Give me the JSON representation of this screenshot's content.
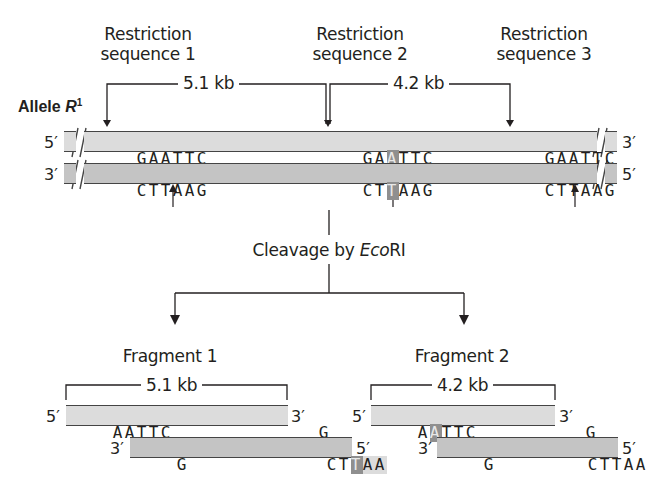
{
  "top": {
    "site_labels": [
      {
        "line1": "Restriction",
        "line2": "sequence 1"
      },
      {
        "line1": "Restriction",
        "line2": "sequence 2"
      },
      {
        "line1": "Restriction",
        "line2": "sequence 3"
      }
    ],
    "distances": [
      "5.1 kb",
      "4.2 kb"
    ],
    "allele_label": "Allele ",
    "allele_name": "R",
    "allele_superscript": "1",
    "top_strand": {
      "left_end": "5′",
      "right_end": "3′",
      "site1": [
        "G",
        "A",
        "A",
        "T",
        "T",
        "C"
      ],
      "site2": [
        "G",
        "A",
        "A",
        "T",
        "T",
        "C"
      ],
      "site2_highlight_index": 2,
      "site3": [
        "G",
        "A",
        "A",
        "T",
        "T",
        "C"
      ]
    },
    "bottom_strand": {
      "left_end": "3′",
      "right_end": "5′",
      "site1": [
        "C",
        "T",
        "T",
        "A",
        "A",
        "G"
      ],
      "site2": [
        "C",
        "T",
        "T",
        "A",
        "A",
        "G"
      ],
      "site2_highlight_index": 2,
      "site3": [
        "C",
        "T",
        "T",
        "A",
        "A",
        "G"
      ]
    }
  },
  "process": {
    "label_prefix": "Cleavage by ",
    "enzyme_italic": "Eco",
    "enzyme_suffix": "RI"
  },
  "fragments": [
    {
      "title": "Fragment 1",
      "length": "5.1 kb",
      "top": {
        "left_end": "5′",
        "left_seq": [
          "A",
          "A",
          "T",
          "T",
          "C"
        ],
        "left_highlight_index": -1,
        "right_seq": [
          "G"
        ],
        "right_end": "3′"
      },
      "bottom": {
        "left_end": "3′",
        "left_seq": [
          "G"
        ],
        "right_seq": [
          "C",
          "T",
          "T",
          "A",
          "A"
        ],
        "right_highlight_index": 2,
        "right_end": "5′"
      }
    },
    {
      "title": "Fragment 2",
      "length": "4.2 kb",
      "top": {
        "left_end": "5′",
        "left_seq": [
          "A",
          "A",
          "T",
          "T",
          "C"
        ],
        "left_highlight_index": 1,
        "right_seq": [
          "G"
        ],
        "right_end": "3′"
      },
      "bottom": {
        "left_end": "3′",
        "left_seq": [
          "G"
        ],
        "right_seq": [
          "C",
          "T",
          "T",
          "A",
          "A"
        ],
        "right_highlight_index": -1,
        "right_end": "5′"
      }
    }
  ],
  "colors": {
    "strand_top_fill": "#dcdcdc",
    "strand_bottom_fill": "#c4c4c4",
    "mutation_highlight": "#8f8f8f",
    "ink": "#231f20"
  }
}
